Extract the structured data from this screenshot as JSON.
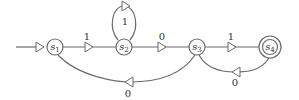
{
  "diagram": {
    "type": "finite-state-machine",
    "start_state": "s1",
    "accepting_states": [
      "s4"
    ],
    "states": [
      {
        "id": "s1",
        "base": "s",
        "sub": "1",
        "accepting": false
      },
      {
        "id": "s2",
        "base": "s",
        "sub": "2",
        "accepting": false
      },
      {
        "id": "s3",
        "base": "s",
        "sub": "3",
        "accepting": false
      },
      {
        "id": "s4",
        "base": "s",
        "sub": "4",
        "accepting": true
      }
    ],
    "transitions": [
      {
        "from": "s1",
        "to": "s2",
        "label": "1"
      },
      {
        "from": "s2",
        "to": "s2",
        "label": "1"
      },
      {
        "from": "s2",
        "to": "s3",
        "label": "0"
      },
      {
        "from": "s3",
        "to": "s4",
        "label": "1"
      },
      {
        "from": "s3",
        "to": "s1",
        "label": "0"
      },
      {
        "from": "s4",
        "to": "s3",
        "label": "0"
      }
    ],
    "colors": {
      "stroke": "#6b6b6b",
      "text": "#333333",
      "background": "#ffffff"
    }
  }
}
